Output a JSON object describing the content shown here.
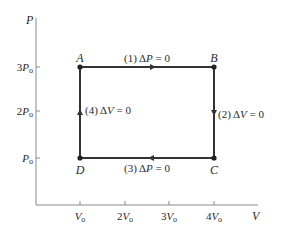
{
  "diagram": {
    "type": "PV cycle diagram",
    "axes": {
      "x_label": "V",
      "y_label": "P",
      "x_ticks": [
        {
          "coef": "",
          "sym": "V",
          "sub": "o"
        },
        {
          "coef": "2",
          "sym": "V",
          "sub": "o"
        },
        {
          "coef": "3",
          "sym": "V",
          "sub": "o"
        },
        {
          "coef": "4",
          "sym": "V",
          "sub": "o"
        }
      ],
      "y_ticks": [
        {
          "coef": "3",
          "sym": "P",
          "sub": "o"
        },
        {
          "coef": "2",
          "sym": "P",
          "sub": "o"
        },
        {
          "coef": "",
          "sym": "P",
          "sub": "o"
        }
      ]
    },
    "points": [
      {
        "name": "A",
        "V": "Vo",
        "P": "3Po"
      },
      {
        "name": "B",
        "V": "4Vo",
        "P": "3Po"
      },
      {
        "name": "C",
        "V": "4Vo",
        "P": "Po"
      },
      {
        "name": "D",
        "V": "Vo",
        "P": "Po"
      }
    ],
    "processes": [
      {
        "num": "(1)",
        "delta": "Δ",
        "var": "P",
        "eq": " = 0",
        "from": "A",
        "to": "B",
        "direction": "right"
      },
      {
        "num": "(2)",
        "delta": "Δ",
        "var": "V",
        "eq": " = 0",
        "from": "B",
        "to": "C",
        "direction": "down"
      },
      {
        "num": "(3)",
        "delta": "Δ",
        "var": "P",
        "eq": " = 0",
        "from": "C",
        "to": "D",
        "direction": "left"
      },
      {
        "num": "(4)",
        "delta": "Δ",
        "var": "V",
        "eq": " = 0",
        "from": "D",
        "to": "A",
        "direction": "up"
      }
    ],
    "colors": {
      "line": "#333333",
      "axis": "#8a8a8a",
      "text": "#2a2a2a",
      "background": "#ffffff"
    }
  }
}
